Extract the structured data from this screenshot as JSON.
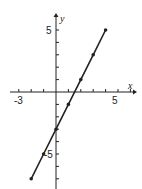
{
  "chart_data": {
    "type": "line",
    "title": "",
    "xlabel": "x",
    "ylabel": "y",
    "xlim": [
      -4,
      6
    ],
    "ylim": [
      -8,
      6
    ],
    "grid": false,
    "x_tick_labels": [
      "-3",
      "5"
    ],
    "y_tick_labels": [
      "5",
      "-5"
    ],
    "series": [
      {
        "name": "y = 2x - 3",
        "x": [
          -2,
          -1,
          0,
          1,
          2,
          3,
          4
        ],
        "y": [
          -7,
          -5,
          -3,
          -1,
          1,
          3,
          5
        ],
        "markers": true
      }
    ]
  },
  "labels": {
    "x_axis": "x",
    "y_axis": "y",
    "x_neg": "-3",
    "x_pos": "5",
    "y_pos": "5",
    "y_neg": "-5"
  },
  "colors": {
    "ink": "#222222",
    "background": "#ffffff"
  }
}
